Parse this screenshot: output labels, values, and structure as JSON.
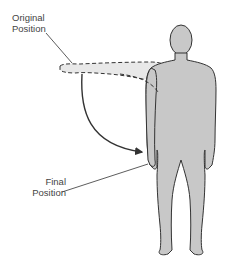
{
  "diagram": {
    "labels": {
      "original_line1": "Original",
      "original_line2": "Position",
      "final_line1": "Final",
      "final_line2": "Position"
    },
    "colors": {
      "body_fill": "#c8c8c8",
      "outline": "#333333",
      "arm_ghost_fill": "#e6e6e6",
      "text": "#444444"
    }
  }
}
